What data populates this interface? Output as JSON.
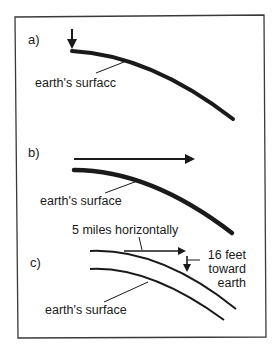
{
  "figure": {
    "panels": [
      {
        "id": "a",
        "label": "a)",
        "surface_label": "earth's surfacc",
        "arrow": "downward"
      },
      {
        "id": "b",
        "label": "b)",
        "surface_label": "earth's surface",
        "arrow": "horizontal"
      },
      {
        "id": "c",
        "label": "c)",
        "surface_label": "earth's surface",
        "horizontal_label": "5 miles horizontally",
        "fall_label_line1": "16 feet",
        "fall_label_line2": "toward",
        "fall_label_line3": "earth"
      }
    ],
    "colors": {
      "ink": "#1a1a1a",
      "frame": "#3a3a3a",
      "background": "#ffffff"
    }
  }
}
